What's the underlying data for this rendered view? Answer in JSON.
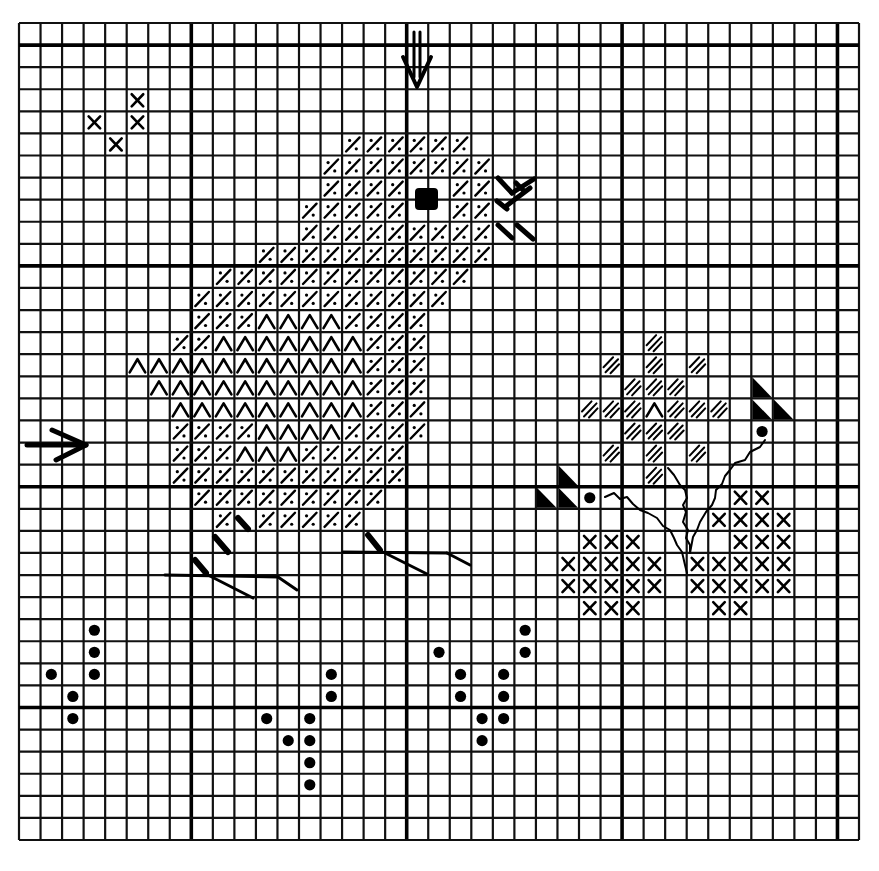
{
  "title": "Cross-stitch chart: chick with flowers",
  "grid": {
    "x0": 19,
    "y0": 23,
    "width": 840,
    "height": 817,
    "cols": 39,
    "rows": 37,
    "major_cols": [
      8,
      18,
      28,
      38
    ],
    "major_rows": [
      1,
      11,
      21,
      31
    ],
    "line_color": "#000000",
    "background": "#ffffff"
  },
  "legend_symbols": {
    "slash_dot": "diagonal slash with two dots (chick body)",
    "chevron": "Λ chevron (wing)",
    "double_hatch": "double diagonal hatch (flower)",
    "cross": "X cross stitch",
    "dot": "filled dot (french knot / bud)",
    "half_triangle": "half-filled triangle (half stitch)",
    "eye": "filled square (eye)"
  },
  "center_markers": {
    "top_arrow": {
      "x": 417,
      "y1": 32,
      "y2": 87,
      "direction": "down"
    },
    "left_arrow": {
      "y": 445,
      "x1": 27,
      "x2": 86,
      "direction": "right"
    }
  },
  "cells": {
    "slash_dot": [
      [
        5,
        15
      ],
      [
        5,
        16
      ],
      [
        5,
        17
      ],
      [
        5,
        18
      ],
      [
        5,
        19
      ],
      [
        5,
        20
      ],
      [
        6,
        14
      ],
      [
        6,
        15
      ],
      [
        6,
        16
      ],
      [
        6,
        17
      ],
      [
        6,
        18
      ],
      [
        6,
        19
      ],
      [
        6,
        20
      ],
      [
        6,
        21
      ],
      [
        7,
        14
      ],
      [
        7,
        15
      ],
      [
        7,
        16
      ],
      [
        7,
        17
      ],
      [
        7,
        20
      ],
      [
        7,
        21
      ],
      [
        8,
        13
      ],
      [
        8,
        14
      ],
      [
        8,
        15
      ],
      [
        8,
        16
      ],
      [
        8,
        17
      ],
      [
        8,
        20
      ],
      [
        8,
        21
      ],
      [
        9,
        13
      ],
      [
        9,
        14
      ],
      [
        9,
        15
      ],
      [
        9,
        16
      ],
      [
        9,
        17
      ],
      [
        9,
        18
      ],
      [
        9,
        19
      ],
      [
        9,
        20
      ],
      [
        9,
        21
      ],
      [
        10,
        11
      ],
      [
        10,
        12
      ],
      [
        10,
        13
      ],
      [
        10,
        14
      ],
      [
        10,
        15
      ],
      [
        10,
        16
      ],
      [
        10,
        17
      ],
      [
        10,
        18
      ],
      [
        10,
        19
      ],
      [
        10,
        20
      ],
      [
        10,
        21
      ],
      [
        11,
        9
      ],
      [
        11,
        10
      ],
      [
        11,
        11
      ],
      [
        11,
        12
      ],
      [
        11,
        13
      ],
      [
        11,
        14
      ],
      [
        11,
        15
      ],
      [
        11,
        16
      ],
      [
        11,
        17
      ],
      [
        11,
        18
      ],
      [
        11,
        19
      ],
      [
        11,
        20
      ],
      [
        12,
        8
      ],
      [
        12,
        9
      ],
      [
        12,
        10
      ],
      [
        12,
        11
      ],
      [
        12,
        12
      ],
      [
        12,
        13
      ],
      [
        12,
        14
      ],
      [
        12,
        15
      ],
      [
        12,
        16
      ],
      [
        12,
        17
      ],
      [
        12,
        18
      ],
      [
        12,
        19
      ],
      [
        13,
        8
      ],
      [
        13,
        9
      ],
      [
        13,
        10
      ],
      [
        13,
        15
      ],
      [
        13,
        16
      ],
      [
        13,
        17
      ],
      [
        13,
        18
      ],
      [
        14,
        7
      ],
      [
        14,
        8
      ],
      [
        14,
        16
      ],
      [
        14,
        17
      ],
      [
        14,
        18
      ],
      [
        15,
        16
      ],
      [
        15,
        17
      ],
      [
        15,
        18
      ],
      [
        16,
        16
      ],
      [
        16,
        17
      ],
      [
        16,
        18
      ],
      [
        17,
        16
      ],
      [
        17,
        17
      ],
      [
        17,
        18
      ],
      [
        18,
        7
      ],
      [
        18,
        8
      ],
      [
        18,
        9
      ],
      [
        18,
        10
      ],
      [
        18,
        15
      ],
      [
        18,
        16
      ],
      [
        18,
        17
      ],
      [
        18,
        18
      ],
      [
        19,
        7
      ],
      [
        19,
        8
      ],
      [
        19,
        9
      ],
      [
        19,
        13
      ],
      [
        19,
        14
      ],
      [
        19,
        15
      ],
      [
        19,
        16
      ],
      [
        19,
        17
      ],
      [
        20,
        7
      ],
      [
        20,
        8
      ],
      [
        20,
        9
      ],
      [
        20,
        10
      ],
      [
        20,
        11
      ],
      [
        20,
        12
      ],
      [
        20,
        13
      ],
      [
        20,
        14
      ],
      [
        20,
        15
      ],
      [
        20,
        16
      ],
      [
        20,
        17
      ],
      [
        21,
        8
      ],
      [
        21,
        9
      ],
      [
        21,
        10
      ],
      [
        21,
        11
      ],
      [
        21,
        12
      ],
      [
        21,
        13
      ],
      [
        21,
        14
      ],
      [
        21,
        15
      ],
      [
        21,
        16
      ],
      [
        22,
        9
      ],
      [
        22,
        11
      ],
      [
        22,
        12
      ],
      [
        22,
        13
      ],
      [
        22,
        14
      ],
      [
        22,
        15
      ]
    ],
    "chevron": [
      [
        13,
        11
      ],
      [
        13,
        12
      ],
      [
        13,
        13
      ],
      [
        13,
        14
      ],
      [
        14,
        9
      ],
      [
        14,
        10
      ],
      [
        14,
        11
      ],
      [
        14,
        12
      ],
      [
        14,
        13
      ],
      [
        14,
        14
      ],
      [
        14,
        15
      ],
      [
        15,
        5
      ],
      [
        15,
        6
      ],
      [
        15,
        7
      ],
      [
        15,
        8
      ],
      [
        15,
        9
      ],
      [
        15,
        10
      ],
      [
        15,
        11
      ],
      [
        15,
        12
      ],
      [
        15,
        13
      ],
      [
        15,
        14
      ],
      [
        15,
        15
      ],
      [
        16,
        6
      ],
      [
        16,
        7
      ],
      [
        16,
        8
      ],
      [
        16,
        9
      ],
      [
        16,
        10
      ],
      [
        16,
        11
      ],
      [
        16,
        12
      ],
      [
        16,
        13
      ],
      [
        16,
        14
      ],
      [
        16,
        15
      ],
      [
        17,
        7
      ],
      [
        17,
        8
      ],
      [
        17,
        9
      ],
      [
        17,
        10
      ],
      [
        17,
        11
      ],
      [
        17,
        12
      ],
      [
        17,
        13
      ],
      [
        17,
        14
      ],
      [
        17,
        15
      ],
      [
        18,
        11
      ],
      [
        18,
        12
      ],
      [
        18,
        13
      ],
      [
        18,
        14
      ],
      [
        19,
        10
      ],
      [
        19,
        11
      ],
      [
        19,
        12
      ],
      [
        17,
        29
      ]
    ],
    "double_hatch": [
      [
        14,
        29
      ],
      [
        15,
        27
      ],
      [
        15,
        29
      ],
      [
        15,
        31
      ],
      [
        16,
        28
      ],
      [
        16,
        29
      ],
      [
        16,
        30
      ],
      [
        17,
        26
      ],
      [
        17,
        27
      ],
      [
        17,
        28
      ],
      [
        17,
        30
      ],
      [
        17,
        31
      ],
      [
        17,
        32
      ],
      [
        18,
        28
      ],
      [
        18,
        29
      ],
      [
        18,
        30
      ],
      [
        19,
        27
      ],
      [
        19,
        29
      ],
      [
        19,
        31
      ],
      [
        20,
        29
      ]
    ],
    "cross": [
      [
        3,
        5
      ],
      [
        4,
        3
      ],
      [
        4,
        5
      ],
      [
        5,
        4
      ],
      [
        21,
        33
      ],
      [
        21,
        34
      ],
      [
        22,
        32
      ],
      [
        22,
        33
      ],
      [
        22,
        34
      ],
      [
        22,
        35
      ],
      [
        23,
        26
      ],
      [
        23,
        27
      ],
      [
        23,
        28
      ],
      [
        23,
        33
      ],
      [
        23,
        34
      ],
      [
        23,
        35
      ],
      [
        24,
        25
      ],
      [
        24,
        26
      ],
      [
        24,
        27
      ],
      [
        24,
        28
      ],
      [
        24,
        29
      ],
      [
        24,
        31
      ],
      [
        24,
        32
      ],
      [
        24,
        33
      ],
      [
        24,
        34
      ],
      [
        24,
        35
      ],
      [
        25,
        25
      ],
      [
        25,
        26
      ],
      [
        25,
        27
      ],
      [
        25,
        28
      ],
      [
        25,
        29
      ],
      [
        25,
        31
      ],
      [
        25,
        32
      ],
      [
        25,
        33
      ],
      [
        25,
        34
      ],
      [
        25,
        35
      ],
      [
        26,
        26
      ],
      [
        26,
        27
      ],
      [
        26,
        28
      ],
      [
        26,
        32
      ],
      [
        26,
        33
      ]
    ],
    "dot": [
      [
        21,
        26
      ],
      [
        18,
        34
      ],
      [
        27,
        3
      ],
      [
        28,
        3
      ],
      [
        29,
        1
      ],
      [
        29,
        3
      ],
      [
        30,
        2
      ],
      [
        31,
        2
      ],
      [
        29,
        14
      ],
      [
        30,
        14
      ],
      [
        31,
        11
      ],
      [
        31,
        13
      ],
      [
        32,
        12
      ],
      [
        32,
        13
      ],
      [
        33,
        13
      ],
      [
        34,
        13
      ],
      [
        27,
        23
      ],
      [
        28,
        23
      ],
      [
        28,
        19
      ],
      [
        29,
        20
      ],
      [
        29,
        22
      ],
      [
        30,
        20
      ],
      [
        30,
        22
      ],
      [
        31,
        21
      ],
      [
        31,
        22
      ],
      [
        32,
        21
      ]
    ],
    "half_triangle": [
      [
        16,
        34
      ],
      [
        17,
        34
      ],
      [
        17,
        35
      ],
      [
        20,
        25
      ],
      [
        21,
        24
      ],
      [
        21,
        25
      ]
    ]
  },
  "eye": {
    "x": 415,
    "y": 188,
    "w": 23,
    "h": 22
  },
  "strokes": {
    "beak": [
      [
        [
          498,
          178
        ],
        [
          512,
          193
        ]
      ],
      [
        [
          512,
          193
        ],
        [
          534,
          179
        ]
      ],
      [
        [
          516,
          183
        ],
        [
          524,
          191
        ]
      ],
      [
        [
          497,
          201
        ],
        [
          507,
          209
        ]
      ],
      [
        [
          505,
          207
        ],
        [
          530,
          188
        ]
      ],
      [
        [
          498,
          225
        ],
        [
          512,
          238
        ]
      ],
      [
        [
          517,
          225
        ],
        [
          533,
          239
        ]
      ]
    ],
    "leg_marks": [
      [
        [
          238,
          518
        ],
        [
          248,
          529
        ]
      ],
      [
        [
          215,
          537
        ],
        [
          228,
          552
        ]
      ],
      [
        [
          195,
          560
        ],
        [
          206,
          573
        ]
      ],
      [
        [
          368,
          535
        ],
        [
          380,
          550
        ]
      ]
    ],
    "feet_thin": [
      [
        [
          165,
          575
        ],
        [
          278,
          577
        ]
      ],
      [
        [
          208,
          575
        ],
        [
          253,
          598
        ]
      ],
      [
        [
          278,
          577
        ],
        [
          297,
          590
        ]
      ],
      [
        [
          343,
          552
        ],
        [
          447,
          553
        ]
      ],
      [
        [
          385,
          553
        ],
        [
          427,
          574
        ]
      ],
      [
        [
          447,
          553
        ],
        [
          470,
          565
        ]
      ]
    ],
    "stems": [
      [
        [
          605,
          497
        ],
        [
          614,
          493
        ],
        [
          620,
          499
        ],
        [
          627,
          497
        ],
        [
          633,
          504
        ],
        [
          640,
          510
        ],
        [
          648,
          513
        ],
        [
          657,
          518
        ],
        [
          663,
          526
        ],
        [
          670,
          530
        ],
        [
          674,
          538
        ],
        [
          677,
          545
        ],
        [
          682,
          552
        ],
        [
          685,
          565
        ],
        [
          687,
          573
        ]
      ],
      [
        [
          668,
          468
        ],
        [
          674,
          475
        ],
        [
          680,
          485
        ],
        [
          685,
          490
        ],
        [
          687,
          498
        ],
        [
          683,
          505
        ],
        [
          686,
          512
        ],
        [
          683,
          522
        ],
        [
          688,
          530
        ],
        [
          686,
          538
        ],
        [
          690,
          545
        ],
        [
          690,
          553
        ]
      ],
      [
        [
          765,
          440
        ],
        [
          760,
          447
        ],
        [
          750,
          452
        ],
        [
          745,
          460
        ],
        [
          735,
          463
        ],
        [
          730,
          470
        ],
        [
          725,
          476
        ],
        [
          722,
          484
        ],
        [
          716,
          490
        ],
        [
          715,
          498
        ],
        [
          712,
          505
        ],
        [
          706,
          512
        ],
        [
          700,
          522
        ],
        [
          697,
          530
        ],
        [
          693,
          537
        ],
        [
          690,
          553
        ]
      ]
    ]
  }
}
